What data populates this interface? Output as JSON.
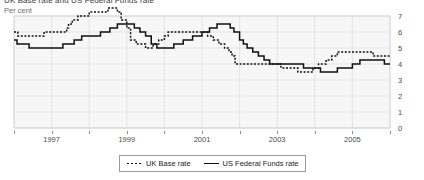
{
  "figure": {
    "title": "UK Base rate and US Federal Funds rate",
    "axis_title": "Per cent"
  },
  "legend": {
    "position": "bottom-center",
    "items": [
      {
        "label": "UK Base rate",
        "style": "dotted",
        "color": "#111111"
      },
      {
        "label": "US Federal Funds rate",
        "style": "solid",
        "color": "#111111"
      }
    ]
  },
  "chart_data": {
    "type": "line",
    "title": "UK Base rate and US Federal Funds rate",
    "subtitle": "",
    "xlabel": "",
    "ylabel": "Per cent",
    "xlim": [
      1996.0,
      2006.0
    ],
    "ylim": [
      0,
      7
    ],
    "yticks": [
      0,
      1,
      2,
      3,
      4,
      5,
      6,
      7
    ],
    "ytick_labels": [
      "0",
      "1",
      "2",
      "3",
      "4",
      "5",
      "6",
      "7"
    ],
    "y_axis_side": "right",
    "xticks_major": [
      1997,
      1999,
      2001,
      2003,
      2005
    ],
    "xtick_labels": [
      "1997",
      "1999",
      "2001",
      "2003",
      "2005"
    ],
    "xticks_minor": [
      1996,
      1998,
      2000,
      2002,
      2004,
      2006
    ],
    "grid": "horizontal-and-vertical-light",
    "plot_background": "#f7f7f7",
    "step_interpolation": "post",
    "series": [
      {
        "name": "UK Base rate",
        "style": "dotted",
        "color": "#111111",
        "points": [
          [
            1996.0,
            6.0
          ],
          [
            1996.1,
            5.75
          ],
          [
            1996.45,
            5.75
          ],
          [
            1996.5,
            5.75
          ],
          [
            1996.55,
            5.75
          ],
          [
            1996.58,
            5.75
          ],
          [
            1996.6,
            5.75
          ],
          [
            1996.7,
            5.75
          ],
          [
            1996.8,
            6.0
          ],
          [
            1997.0,
            6.0
          ],
          [
            1997.35,
            6.0
          ],
          [
            1997.4,
            6.25
          ],
          [
            1997.45,
            6.5
          ],
          [
            1997.55,
            6.75
          ],
          [
            1997.7,
            7.0
          ],
          [
            1998.0,
            7.25
          ],
          [
            1998.5,
            7.5
          ],
          [
            1998.75,
            7.25
          ],
          [
            1998.85,
            6.75
          ],
          [
            1999.0,
            6.25
          ],
          [
            1999.1,
            5.5
          ],
          [
            1999.25,
            5.25
          ],
          [
            1999.5,
            5.0
          ],
          [
            1999.7,
            5.25
          ],
          [
            1999.85,
            5.5
          ],
          [
            2000.0,
            5.75
          ],
          [
            2000.1,
            6.0
          ],
          [
            2000.2,
            6.0
          ],
          [
            2001.0,
            6.0
          ],
          [
            2001.15,
            5.75
          ],
          [
            2001.3,
            5.5
          ],
          [
            2001.45,
            5.25
          ],
          [
            2001.6,
            5.0
          ],
          [
            2001.72,
            4.75
          ],
          [
            2001.8,
            4.5
          ],
          [
            2001.88,
            4.0
          ],
          [
            2002.0,
            4.0
          ],
          [
            2002.5,
            4.0
          ],
          [
            2003.1,
            3.75
          ],
          [
            2003.55,
            3.5
          ],
          [
            2003.8,
            3.5
          ],
          [
            2003.95,
            3.75
          ],
          [
            2004.1,
            4.0
          ],
          [
            2004.3,
            4.25
          ],
          [
            2004.45,
            4.5
          ],
          [
            2004.6,
            4.75
          ],
          [
            2005.0,
            4.75
          ],
          [
            2005.55,
            4.5
          ],
          [
            2006.0,
            4.5
          ]
        ]
      },
      {
        "name": "US Federal Funds rate",
        "style": "solid",
        "color": "#111111",
        "points": [
          [
            1996.0,
            5.5
          ],
          [
            1996.08,
            5.25
          ],
          [
            1996.3,
            5.25
          ],
          [
            1996.4,
            5.0
          ],
          [
            1996.6,
            5.0
          ],
          [
            1996.85,
            5.0
          ],
          [
            1997.0,
            5.0
          ],
          [
            1997.3,
            5.25
          ],
          [
            1997.6,
            5.5
          ],
          [
            1997.8,
            5.75
          ],
          [
            1998.0,
            5.75
          ],
          [
            1998.3,
            6.0
          ],
          [
            1998.55,
            6.25
          ],
          [
            1998.75,
            6.5
          ],
          [
            1999.0,
            6.5
          ],
          [
            1999.2,
            6.25
          ],
          [
            1999.35,
            6.0
          ],
          [
            1999.5,
            5.75
          ],
          [
            1999.65,
            5.25
          ],
          [
            1999.8,
            5.0
          ],
          [
            2000.0,
            5.0
          ],
          [
            2000.25,
            5.25
          ],
          [
            2000.5,
            5.5
          ],
          [
            2000.75,
            5.75
          ],
          [
            2001.0,
            6.0
          ],
          [
            2001.2,
            6.25
          ],
          [
            2001.4,
            6.5
          ],
          [
            2001.6,
            6.5
          ],
          [
            2001.75,
            6.25
          ],
          [
            2001.85,
            6.0
          ],
          [
            2002.0,
            5.5
          ],
          [
            2002.1,
            5.25
          ],
          [
            2002.2,
            5.0
          ],
          [
            2002.35,
            4.75
          ],
          [
            2002.5,
            4.5
          ],
          [
            2002.65,
            4.25
          ],
          [
            2002.8,
            4.0
          ],
          [
            2003.0,
            4.0
          ],
          [
            2003.5,
            4.0
          ],
          [
            2003.7,
            3.75
          ],
          [
            2003.95,
            3.75
          ],
          [
            2004.15,
            3.5
          ],
          [
            2004.45,
            3.5
          ],
          [
            2004.6,
            3.75
          ],
          [
            2004.8,
            3.75
          ],
          [
            2005.0,
            4.0
          ],
          [
            2005.2,
            4.25
          ],
          [
            2005.7,
            4.25
          ],
          [
            2005.85,
            4.0
          ],
          [
            2006.0,
            4.0
          ]
        ]
      }
    ]
  }
}
